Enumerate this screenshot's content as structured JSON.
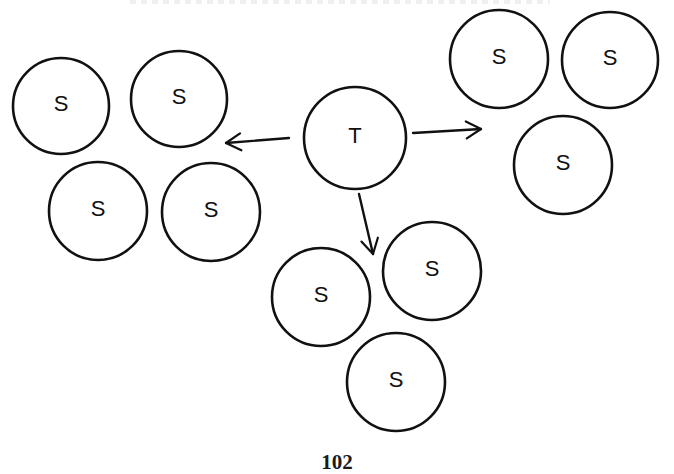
{
  "diagram": {
    "center_node": {
      "label": "T",
      "cx": 355,
      "cy": 138,
      "r": 51
    },
    "groups": [
      {
        "name": "left-group",
        "nodes": [
          {
            "label": "S",
            "cx": 61,
            "cy": 106,
            "r": 48
          },
          {
            "label": "S",
            "cx": 179,
            "cy": 99,
            "r": 48
          },
          {
            "label": "S",
            "cx": 98,
            "cy": 211,
            "r": 49
          },
          {
            "label": "S",
            "cx": 211,
            "cy": 212,
            "r": 49
          }
        ]
      },
      {
        "name": "right-group",
        "nodes": [
          {
            "label": "S",
            "cx": 499,
            "cy": 59,
            "r": 49
          },
          {
            "label": "S",
            "cx": 610,
            "cy": 60,
            "r": 48
          },
          {
            "label": "S",
            "cx": 563,
            "cy": 165,
            "r": 49
          }
        ]
      },
      {
        "name": "bottom-group",
        "nodes": [
          {
            "label": "S",
            "cx": 321,
            "cy": 297,
            "r": 49
          },
          {
            "label": "S",
            "cx": 432,
            "cy": 271,
            "r": 49
          },
          {
            "label": "S",
            "cx": 396,
            "cy": 382,
            "r": 49
          }
        ]
      }
    ],
    "arrows": [
      {
        "name": "arrow-to-left-group",
        "x1": 289,
        "y1": 138,
        "x2": 226,
        "y2": 143
      },
      {
        "name": "arrow-to-right-group",
        "x1": 413,
        "y1": 133,
        "x2": 481,
        "y2": 129
      },
      {
        "name": "arrow-to-bottom-group",
        "x1": 359,
        "y1": 194,
        "x2": 373,
        "y2": 254
      }
    ],
    "stroke_color": "#111111",
    "background_color": "#ffffff"
  },
  "page": {
    "number": "102"
  }
}
